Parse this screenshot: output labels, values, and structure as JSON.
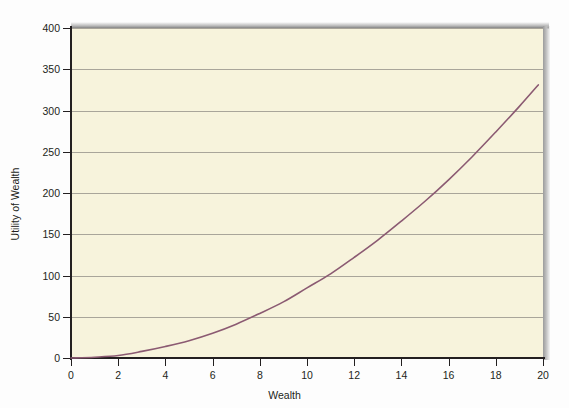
{
  "figure": {
    "background_color": "#fdfdfd",
    "plot_background_color": "#f7f3dc",
    "axis_color": "#231f20",
    "gridline_color": "#a9a59a"
  },
  "chart_data": {
    "type": "line",
    "title": "",
    "xlabel": "Wealth",
    "ylabel": "Utility of Wealth",
    "xlim": [
      0,
      20
    ],
    "ylim": [
      0,
      400
    ],
    "xticks": [
      0,
      2,
      4,
      6,
      8,
      10,
      12,
      14,
      16,
      18,
      20
    ],
    "xtick_labels": [
      "0",
      "2",
      "4",
      "6",
      "8",
      "10",
      "12",
      "14",
      "16",
      "18",
      "20"
    ],
    "yticks": [
      0,
      50,
      100,
      150,
      200,
      250,
      300,
      350,
      400
    ],
    "ytick_labels": [
      "0",
      "50",
      "100",
      "150",
      "200",
      "250",
      "300",
      "350",
      "400"
    ],
    "grid": {
      "horizontal": true,
      "vertical": false
    },
    "legend": null,
    "series": [
      {
        "name": "Utility of Wealth",
        "color": "#8b5a72",
        "line_width": 1.6,
        "relation": "convex increasing (risk-seeking utility), u = 0.845 * W^2",
        "x": [
          0,
          1,
          2,
          3,
          4,
          5,
          6,
          7,
          8,
          9,
          10,
          11,
          12,
          13,
          14,
          15,
          16,
          17,
          18,
          19,
          19.8
        ],
        "values": [
          0,
          1,
          3,
          8,
          14,
          21,
          30,
          41,
          54,
          68,
          85,
          102,
          122,
          143,
          166,
          190,
          216,
          244,
          274,
          305,
          331
        ]
      }
    ],
    "annotations": []
  }
}
